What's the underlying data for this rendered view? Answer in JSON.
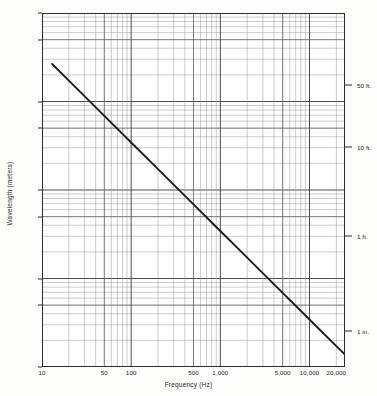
{
  "chart_data": {
    "type": "line",
    "title": "",
    "xlabel": "Frequency (Hz)",
    "ylabel": "Wavelength (meters)",
    "xscale": "log",
    "yscale": "log",
    "xlim": [
      10,
      25000
    ],
    "ylim": [
      0.01,
      100
    ],
    "grid": true,
    "legend": null,
    "x_ticks": [
      {
        "value": 10,
        "label": "10"
      },
      {
        "value": 50,
        "label": "50"
      },
      {
        "value": 100,
        "label": "100"
      },
      {
        "value": 500,
        "label": "500"
      },
      {
        "value": 1000,
        "label": "1,000"
      },
      {
        "value": 5000,
        "label": "5,000"
      },
      {
        "value": 10000,
        "label": "10,000"
      },
      {
        "value": 20000,
        "label": "20,000"
      }
    ],
    "y_ticks": [
      {
        "value": 100,
        "label": "100.0"
      },
      {
        "value": 50,
        "label": "50.0"
      },
      {
        "value": 10,
        "label": "10.0"
      },
      {
        "value": 5,
        "label": "5.0"
      },
      {
        "value": 1,
        "label": "1.0"
      },
      {
        "value": 0.5,
        "label": "0.5"
      },
      {
        "value": 0.1,
        "label": "0.1"
      },
      {
        "value": 0.05,
        "label": "0.05"
      },
      {
        "value": 0.01,
        "label": "0.01"
      }
    ],
    "secondary_y_axis": {
      "side": "right",
      "ticks": [
        {
          "value": 15.24,
          "label": "50 ft."
        },
        {
          "value": 3.048,
          "label": "10 ft."
        },
        {
          "value": 0.3048,
          "label": "1 ft."
        },
        {
          "value": 0.0254,
          "label": "1 in."
        }
      ]
    },
    "series": [
      {
        "name": "wavelength",
        "color": "#1c1c1c",
        "points": [
          {
            "x": 13,
            "y": 26.5
          },
          {
            "x": 20,
            "y": 17.2
          },
          {
            "x": 50,
            "y": 6.88
          },
          {
            "x": 100,
            "y": 3.44
          },
          {
            "x": 200,
            "y": 1.72
          },
          {
            "x": 500,
            "y": 0.688
          },
          {
            "x": 1000,
            "y": 0.344
          },
          {
            "x": 2000,
            "y": 0.172
          },
          {
            "x": 5000,
            "y": 0.0688
          },
          {
            "x": 10000,
            "y": 0.0344
          },
          {
            "x": 20000,
            "y": 0.0172
          },
          {
            "x": 25000,
            "y": 0.0138
          }
        ]
      }
    ]
  },
  "axis_titles": {
    "x": "Frequency (Hz)",
    "y": "Wavelength (meters)"
  }
}
